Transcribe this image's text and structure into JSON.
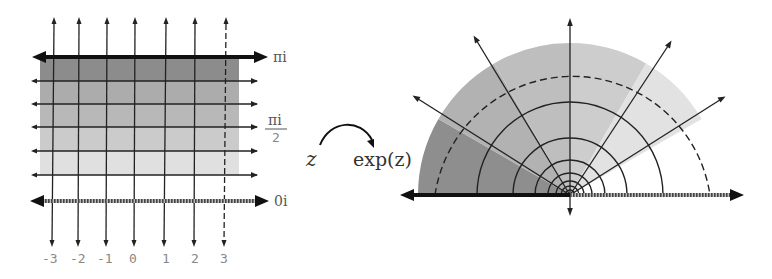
{
  "figure": {
    "left_panel": {
      "name": "rectangular strip in z-plane",
      "x_tick_labels": [
        "-3",
        "-2",
        "-1",
        "0",
        "1",
        "2",
        "3"
      ],
      "y_labels": {
        "top": "πi",
        "middle_numerator": "πi",
        "middle_denominator": "2",
        "bottom": "0i"
      },
      "bands": [
        {
          "from": "5π/6",
          "to": "π",
          "color": "#8c8c8c"
        },
        {
          "from": "4π/6",
          "to": "5π/6",
          "color": "#acacac"
        },
        {
          "from": "3π/6",
          "to": "4π/6",
          "color": "#b8b8b8"
        },
        {
          "from": "2π/6",
          "to": "3π/6",
          "color": "#cbcbcb"
        },
        {
          "from": "π/6",
          "to": "2π/6",
          "color": "#e0e0e0"
        },
        {
          "from": "0",
          "to": "π/6",
          "color": "#ffffff"
        }
      ],
      "dashed_line_at": "3"
    },
    "mapping": {
      "from_label": "z",
      "to_label": "exp(z)"
    },
    "right_panel": {
      "name": "half-disk image in w-plane",
      "ray_angles_deg": [
        30,
        60,
        90,
        120,
        150
      ],
      "circle_radii_px": [
        9,
        14,
        22,
        35,
        57,
        93
      ],
      "dashed_radius_px": 139,
      "outer_radius_px": 152
    }
  }
}
